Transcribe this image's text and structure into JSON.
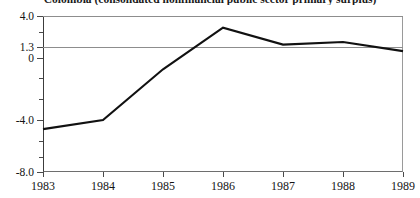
{
  "chart_data": {
    "type": "line",
    "title": "Colombia (consolidated nonfinancial public sector primary surplus)",
    "xlabel": "",
    "ylabel": "",
    "x": [
      1983,
      1984,
      1985,
      1986,
      1987,
      1988,
      1989
    ],
    "categories": [
      "1983",
      "1984",
      "1985",
      "1986",
      "1987",
      "1988",
      "1989"
    ],
    "values": [
      -4.7,
      -4.0,
      -0.1,
      3.1,
      1.8,
      2.0,
      1.3
    ],
    "series": [
      {
        "name": "Primary surplus",
        "values": [
          -4.7,
          -4.0,
          -0.1,
          3.1,
          1.8,
          2.0,
          1.3
        ]
      }
    ],
    "xlim": [
      1983,
      1989
    ],
    "ylim": [
      -8.0,
      4.0
    ],
    "ytick_values": [
      4.0,
      1.3,
      0,
      -4.0,
      -8.0
    ],
    "ytick_labels": [
      "4.0",
      "1.3",
      "0",
      "-4.0",
      "-8.0"
    ],
    "xtick_labels": [
      "1983",
      "1984",
      "1985",
      "1986",
      "1987",
      "1988",
      "1989"
    ],
    "gridlines": [
      4.0,
      1.3
    ],
    "grid": "horizontal reference lines at 4.0 and 1.3",
    "legend": "none",
    "line_color": "#111111"
  },
  "axis": {
    "y": {
      "ticks": [
        {
          "label": "4.0",
          "value": 4.0
        },
        {
          "label": "1.3",
          "value": 1.3
        },
        {
          "label": "0",
          "value": 0
        },
        {
          "label": "-4.0",
          "value": -4.0
        },
        {
          "label": "-8.0",
          "value": -8.0
        }
      ],
      "minor_ticks": [
        2.65,
        -1.3,
        -2.65,
        -5.3,
        -6.65
      ]
    },
    "x": {
      "ticks": [
        {
          "label": "1983",
          "value": 1983
        },
        {
          "label": "1984",
          "value": 1984
        },
        {
          "label": "1985",
          "value": 1985
        },
        {
          "label": "1986",
          "value": 1986
        },
        {
          "label": "1987",
          "value": 1987
        },
        {
          "label": "1988",
          "value": 1988
        },
        {
          "label": "1989",
          "value": 1989
        }
      ]
    }
  },
  "colors": {
    "line": "#111111",
    "gridline": "#8d8d8d",
    "frame": "#6e6e6e",
    "text": "#141414",
    "background": "#ffffff"
  }
}
